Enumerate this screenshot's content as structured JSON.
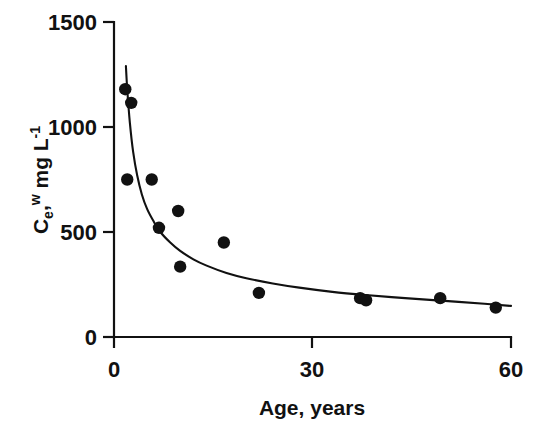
{
  "chart_data": {
    "type": "scatter",
    "title": "",
    "xlabel": "Age, years",
    "ylabel": "Ce, w mg L-1",
    "ylabel_parts": {
      "base1": "C",
      "sub1": "e",
      "comma": ",",
      "sup1": "w",
      "base2": " mg L",
      "sup2": "-1"
    },
    "xlim": [
      0,
      60
    ],
    "ylim": [
      0,
      1500
    ],
    "xticks": [
      0,
      30,
      60
    ],
    "xtick_labels": [
      "0",
      "30",
      "60"
    ],
    "yticks": [
      0,
      500,
      1000,
      1500
    ],
    "ytick_labels": [
      "0",
      "500",
      "1000",
      "1500"
    ],
    "grid": false,
    "legend": false,
    "marker": "filled-circle",
    "marker_color": "#111111",
    "curve_color": "#111111",
    "axis_color": "#111111",
    "background": "#ffffff",
    "points": [
      {
        "x": 1.7,
        "y": 1180
      },
      {
        "x": 2.6,
        "y": 1115
      },
      {
        "x": 2.0,
        "y": 750
      },
      {
        "x": 5.7,
        "y": 750
      },
      {
        "x": 6.8,
        "y": 520
      },
      {
        "x": 9.7,
        "y": 600
      },
      {
        "x": 10.0,
        "y": 335
      },
      {
        "x": 16.6,
        "y": 450
      },
      {
        "x": 21.9,
        "y": 210
      },
      {
        "x": 37.2,
        "y": 185
      },
      {
        "x": 38.1,
        "y": 175
      },
      {
        "x": 49.3,
        "y": 185
      },
      {
        "x": 57.7,
        "y": 140
      }
    ],
    "fit_curve": {
      "description": "decaying power-law fit through data",
      "x_start": 1.8,
      "x_end": 60,
      "y_start": 1290,
      "y_end": 145,
      "points": [
        {
          "x": 1.8,
          "y": 1290
        },
        {
          "x": 2.0,
          "y": 1180
        },
        {
          "x": 2.4,
          "y": 1020
        },
        {
          "x": 2.9,
          "y": 880
        },
        {
          "x": 3.5,
          "y": 770
        },
        {
          "x": 4.2,
          "y": 680
        },
        {
          "x": 5.0,
          "y": 610
        },
        {
          "x": 6.0,
          "y": 550
        },
        {
          "x": 7.0,
          "y": 500
        },
        {
          "x": 8.5,
          "y": 450
        },
        {
          "x": 10.0,
          "y": 410
        },
        {
          "x": 12.0,
          "y": 370
        },
        {
          "x": 14.0,
          "y": 340
        },
        {
          "x": 17.0,
          "y": 305
        },
        {
          "x": 20.0,
          "y": 280
        },
        {
          "x": 24.0,
          "y": 255
        },
        {
          "x": 28.0,
          "y": 235
        },
        {
          "x": 33.0,
          "y": 215
        },
        {
          "x": 38.0,
          "y": 200
        },
        {
          "x": 44.0,
          "y": 185
        },
        {
          "x": 50.0,
          "y": 172
        },
        {
          "x": 56.0,
          "y": 158
        },
        {
          "x": 60.0,
          "y": 148
        }
      ]
    }
  },
  "axes": {
    "x_axis_name": "age-axis",
    "y_axis_name": "concentration-axis"
  }
}
